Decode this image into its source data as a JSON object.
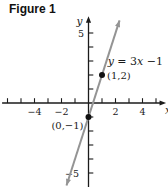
{
  "figure_title": "Figure 1",
  "chart_data": {
    "type": "line",
    "title": "Figure 1",
    "equation": {
      "slope": 3,
      "intercept": -1,
      "label_parts": [
        {
          "text": "y",
          "italic": true
        },
        {
          "text": " = 3",
          "italic": false
        },
        {
          "text": "x",
          "italic": true
        },
        {
          "text": " −1",
          "italic": false
        }
      ],
      "label_anchor_units": {
        "x": 1.42,
        "y": 2.7
      }
    },
    "axes": {
      "xlabel": "x",
      "ylabel": "y",
      "xlim": [
        -6.4,
        5.45
      ],
      "ylim": [
        -6.0,
        6.2
      ],
      "x_ticks": [
        -6,
        -5,
        -4,
        -3,
        -2,
        -1,
        1,
        2,
        3,
        4,
        5
      ],
      "y_ticks": [
        -5,
        -4,
        -3,
        -2,
        -1,
        1,
        2,
        3,
        4,
        5
      ],
      "x_labeled_ticks": [
        {
          "value": -4,
          "label": "−4"
        },
        {
          "value": -2,
          "label": "−2"
        },
        {
          "value": 2,
          "label": "2"
        },
        {
          "value": 4,
          "label": "4"
        }
      ],
      "y_labeled_ticks": [
        {
          "value": 5,
          "label": "5",
          "dx": -4.5
        },
        {
          "value": -5,
          "label": "−5",
          "dx": -9.5
        }
      ],
      "grid": false
    },
    "line_x_range": [
      -1.63,
      2.3
    ],
    "points": [
      {
        "x": 1,
        "y": 2,
        "label": "(1,2)",
        "anchor": "start",
        "dx": 5,
        "dy": 4
      },
      {
        "x": 0,
        "y": -1,
        "label": "(0,−1)",
        "anchor": "end",
        "dx": -5,
        "dy": 12
      }
    ],
    "colors": {
      "axis": "#1b1b1b",
      "line": "#949494",
      "point": "#111111",
      "text": "#1b1b1b"
    }
  }
}
